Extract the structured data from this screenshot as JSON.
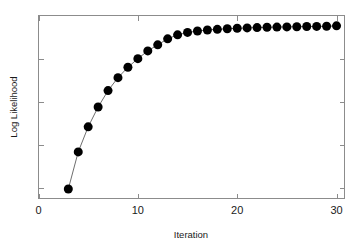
{
  "chart_data": {
    "type": "scatter",
    "title": "",
    "subtitle": "",
    "xlabel": "Iteration",
    "ylabel": "Log Likelihood",
    "xlim": [
      0,
      30.8
    ],
    "ylim": [
      0,
      1.06
    ],
    "xticks": [
      0,
      10,
      20,
      30
    ],
    "xticklabels": [
      "0",
      "10",
      "20",
      "30"
    ],
    "yticks": [
      0.06,
      0.31,
      0.56,
      0.81
    ],
    "yticklabels": [
      "",
      "",
      "",
      ""
    ],
    "grid": false,
    "legend": null,
    "legend_position": "none",
    "marker": "filled-circle",
    "marker_size_px": 9,
    "line_style": "solid-connector",
    "series": [
      {
        "name": "Log likelihood per EM iteration",
        "color": "#000000",
        "x": [
          3,
          4,
          5,
          6,
          7,
          8,
          9,
          10,
          11,
          12,
          13,
          14,
          15,
          16,
          17,
          18,
          19,
          20,
          21,
          22,
          23,
          24,
          25,
          26,
          27,
          28,
          29,
          30
        ],
        "y": [
          0.055,
          0.27,
          0.415,
          0.53,
          0.625,
          0.7,
          0.76,
          0.81,
          0.855,
          0.89,
          0.925,
          0.948,
          0.962,
          0.97,
          0.976,
          0.98,
          0.983,
          0.986,
          0.988,
          0.99,
          0.992,
          0.993,
          0.994,
          0.995,
          0.996,
          0.997,
          0.998,
          1.0
        ]
      }
    ],
    "annotations": []
  },
  "axes": {
    "x_title": "Iteration",
    "y_title": "Log Likelihood"
  },
  "colors": {
    "marker": "#000000",
    "connector_line": "#6e6e6e",
    "frame": "#8c8c8c",
    "background": "#ffffff",
    "text": "#1a1a1a"
  }
}
